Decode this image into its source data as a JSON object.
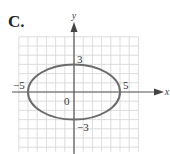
{
  "panel_label": "C.",
  "chart_data": {
    "type": "line",
    "title": "",
    "subtitle": "Graph of ellipse x^2/25 + y^2/9 = 1",
    "xlabel": "x",
    "ylabel": "y",
    "grid": true,
    "xlim": [
      -6,
      7
    ],
    "ylim": [
      -6.5,
      6
    ],
    "series": [
      {
        "name": "ellipse",
        "equation": "x^2/25 + y^2/9 = 1",
        "center": [
          0,
          0
        ],
        "semi_major_x": 5,
        "semi_minor_y": 3,
        "key_points": [
          [
            -5,
            0
          ],
          [
            5,
            0
          ],
          [
            0,
            3
          ],
          [
            0,
            -3
          ]
        ]
      }
    ],
    "annotations": [
      {
        "text": "-5",
        "x": -5,
        "y": 0
      },
      {
        "text": "5",
        "x": 5,
        "y": 0
      },
      {
        "text": "3",
        "x": 0,
        "y": 3
      },
      {
        "text": "-3",
        "x": 0,
        "y": -3
      },
      {
        "text": "0",
        "x": 0,
        "y": 0
      }
    ]
  },
  "labels": {
    "x_axis": "x",
    "y_axis": "y",
    "neg5": "−5",
    "pos5": "5",
    "pos3": "3",
    "neg3": "−3",
    "origin": "0"
  },
  "colors": {
    "grid": "#d4d4d4",
    "axis": "#555555",
    "curve": "#6b6b6b"
  }
}
